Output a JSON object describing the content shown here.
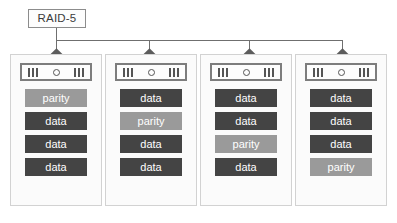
{
  "diagram": {
    "title": "RAID-5",
    "label_box": {
      "text": "RAID-5"
    },
    "colors": {
      "data_fill": "#444444",
      "parity_fill": "#9a9a9a",
      "block_text": "#ffffff",
      "box_border": "#d2d2d2",
      "label_border": "#8c8c8c",
      "connector": "#6f6f6f",
      "diamond": "#5c5c5c",
      "background": "#ffffff"
    },
    "drive_icon": {
      "name": "disk-drive-face",
      "left_vents": 3,
      "right_vents": 3,
      "has_center_dot": true
    },
    "columns": [
      {
        "name": "disk-1",
        "blocks": [
          {
            "label": "parity",
            "type": "parity"
          },
          {
            "label": "data",
            "type": "data"
          },
          {
            "label": "data",
            "type": "data"
          },
          {
            "label": "data",
            "type": "data"
          }
        ]
      },
      {
        "name": "disk-2",
        "blocks": [
          {
            "label": "data",
            "type": "data"
          },
          {
            "label": "parity",
            "type": "parity"
          },
          {
            "label": "data",
            "type": "data"
          },
          {
            "label": "data",
            "type": "data"
          }
        ]
      },
      {
        "name": "disk-3",
        "blocks": [
          {
            "label": "data",
            "type": "data"
          },
          {
            "label": "data",
            "type": "data"
          },
          {
            "label": "parity",
            "type": "parity"
          },
          {
            "label": "data",
            "type": "data"
          }
        ]
      },
      {
        "name": "disk-4",
        "blocks": [
          {
            "label": "data",
            "type": "data"
          },
          {
            "label": "data",
            "type": "data"
          },
          {
            "label": "data",
            "type": "data"
          },
          {
            "label": "parity",
            "type": "parity"
          }
        ]
      }
    ]
  }
}
